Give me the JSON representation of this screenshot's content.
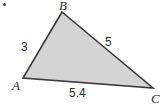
{
  "figure": {
    "kind": "geometry-diagram",
    "shape": "triangle",
    "background_color": "#ffffff",
    "fill_color": "#d4d4d4",
    "stroke_color": "#3a3a3a",
    "stroke_width": 1.6,
    "width": 165,
    "height": 106,
    "corner_marker": {
      "name": "bullet-dot",
      "color": "#4a4a4a",
      "x": 4,
      "y": 4
    },
    "vertices": [
      {
        "id": "B",
        "label": "B",
        "x": 62,
        "y": 12
      },
      {
        "id": "C",
        "label": "C",
        "x": 153,
        "y": 88
      },
      {
        "id": "A",
        "label": "A",
        "x": 23,
        "y": 78
      }
    ],
    "sides": [
      {
        "id": "AB",
        "label": "3",
        "from": "A",
        "to": "B"
      },
      {
        "id": "BC",
        "label": "5",
        "from": "B",
        "to": "C"
      },
      {
        "id": "AC",
        "label": "5.4",
        "from": "A",
        "to": "C"
      }
    ],
    "polygon_points": "62,12 153,88 23,78"
  }
}
